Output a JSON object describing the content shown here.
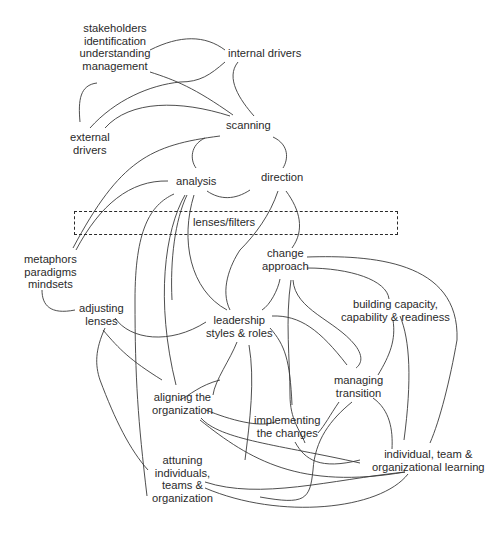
{
  "diagram": {
    "type": "concept-map",
    "nodes": [
      {
        "id": "stakeholders",
        "lines": [
          "stakeholders",
          "identification",
          "understanding",
          "management"
        ]
      },
      {
        "id": "internal-drivers",
        "lines": [
          "internal drivers"
        ]
      },
      {
        "id": "external-drivers",
        "lines": [
          "external",
          "drivers"
        ]
      },
      {
        "id": "scanning",
        "lines": [
          "scanning"
        ]
      },
      {
        "id": "analysis",
        "lines": [
          "analysis"
        ]
      },
      {
        "id": "direction",
        "lines": [
          "direction"
        ]
      },
      {
        "id": "lenses-filters",
        "lines": [
          "lenses/filters"
        ]
      },
      {
        "id": "metaphors",
        "lines": [
          "metaphors",
          "paradigms",
          "mindsets"
        ]
      },
      {
        "id": "change-approach",
        "lines": [
          "change",
          "approach"
        ]
      },
      {
        "id": "adjusting-lenses",
        "lines": [
          "adjusting",
          "lenses"
        ]
      },
      {
        "id": "leadership",
        "lines": [
          "leadership",
          "styles & roles"
        ]
      },
      {
        "id": "building-capacity",
        "lines": [
          "building capacity,",
          "capability & readiness"
        ]
      },
      {
        "id": "managing-transition",
        "lines": [
          "managing",
          "transition"
        ]
      },
      {
        "id": "aligning",
        "lines": [
          "aligning the",
          "organization"
        ]
      },
      {
        "id": "implementing",
        "lines": [
          "implementing",
          "the changes"
        ]
      },
      {
        "id": "learning",
        "lines": [
          "individual, team &",
          "organizational learning"
        ]
      },
      {
        "id": "attuning",
        "lines": [
          "attuning",
          "individuals,",
          "teams &",
          "organization"
        ]
      }
    ],
    "filter_band_label": "lenses/filters",
    "colors": {
      "line": "#3a3a3a",
      "text": "#2a2a2a",
      "background": "#ffffff"
    }
  }
}
